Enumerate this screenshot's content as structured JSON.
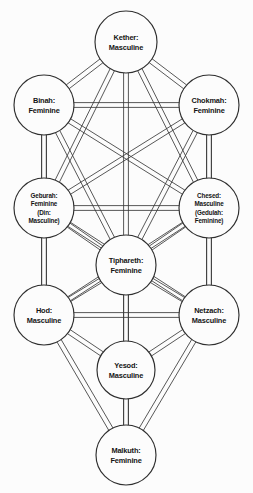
{
  "diagram": {
    "background_color": "#fcfcfc",
    "line_color": "#3a3a3a",
    "node_fill": "#fcfcfc",
    "node_stroke": "#2e2e2e",
    "nodes": [
      {
        "id": "kether",
        "name": "Kether",
        "label_line1": "Kether:",
        "label_line2": "Masculine",
        "gender": "Masculine",
        "cx": 126,
        "cy": 42,
        "r": 31
      },
      {
        "id": "binah",
        "name": "Binah",
        "label_line1": "Binah:",
        "label_line2": "Feminine",
        "gender": "Feminine",
        "cx": 44,
        "cy": 105,
        "r": 30
      },
      {
        "id": "chokmah",
        "name": "Chokmah",
        "label_line1": "Chokmah:",
        "label_line2": "Feminine",
        "gender": "Feminine",
        "cx": 209,
        "cy": 105,
        "r": 30
      },
      {
        "id": "geburah",
        "name": "Geburah",
        "label_line1": "Geburah:",
        "label_line2": "Feminine",
        "label_line3": "(Din:",
        "label_line4": "Masculine)",
        "gender": "Feminine",
        "alt_name": "Din",
        "alt_gender": "Masculine",
        "cx": 44,
        "cy": 208,
        "r": 30
      },
      {
        "id": "chesed",
        "name": "Chesed",
        "label_line1": "Chesed:",
        "label_line2": "Masculine",
        "label_line3": "(Gedulah:",
        "label_line4": "Feminine)",
        "gender": "Masculine",
        "alt_name": "Gedulah",
        "alt_gender": "Feminine",
        "cx": 209,
        "cy": 208,
        "r": 30
      },
      {
        "id": "tiphareth",
        "name": "Tiphareth",
        "label_line1": "Tiphareth:",
        "label_line2": "Feminine",
        "gender": "Feminine",
        "cx": 126,
        "cy": 265,
        "r": 30
      },
      {
        "id": "hod",
        "name": "Hod",
        "label_line1": "Hod:",
        "label_line2": "Masculine",
        "gender": "Masculine",
        "cx": 44,
        "cy": 315,
        "r": 30
      },
      {
        "id": "netzach",
        "name": "Netzach",
        "label_line1": "Netzach:",
        "label_line2": "Masculine",
        "gender": "Masculine",
        "cx": 209,
        "cy": 315,
        "r": 30
      },
      {
        "id": "yesod",
        "name": "Yesod",
        "label_line1": "Yesod:",
        "label_line2": "Masculine",
        "gender": "Masculine",
        "cx": 126,
        "cy": 370,
        "r": 29
      },
      {
        "id": "malkuth",
        "name": "Malkuth",
        "label_line1": "Malkuth:",
        "label_line2": "Feminine",
        "gender": "Feminine",
        "cx": 126,
        "cy": 455,
        "r": 30
      }
    ],
    "edges": [
      {
        "from": "kether",
        "to": "binah"
      },
      {
        "from": "kether",
        "to": "chokmah"
      },
      {
        "from": "kether",
        "to": "geburah"
      },
      {
        "from": "kether",
        "to": "chesed"
      },
      {
        "from": "kether",
        "to": "tiphareth"
      },
      {
        "from": "binah",
        "to": "chokmah"
      },
      {
        "from": "binah",
        "to": "geburah"
      },
      {
        "from": "binah",
        "to": "chesed"
      },
      {
        "from": "binah",
        "to": "tiphareth"
      },
      {
        "from": "binah",
        "to": "hod"
      },
      {
        "from": "chokmah",
        "to": "geburah"
      },
      {
        "from": "chokmah",
        "to": "chesed"
      },
      {
        "from": "chokmah",
        "to": "tiphareth"
      },
      {
        "from": "chokmah",
        "to": "netzach"
      },
      {
        "from": "geburah",
        "to": "chesed"
      },
      {
        "from": "geburah",
        "to": "tiphareth"
      },
      {
        "from": "geburah",
        "to": "hod"
      },
      {
        "from": "geburah",
        "to": "netzach"
      },
      {
        "from": "chesed",
        "to": "tiphareth"
      },
      {
        "from": "chesed",
        "to": "netzach"
      },
      {
        "from": "chesed",
        "to": "hod"
      },
      {
        "from": "tiphareth",
        "to": "hod"
      },
      {
        "from": "tiphareth",
        "to": "netzach"
      },
      {
        "from": "tiphareth",
        "to": "yesod"
      },
      {
        "from": "tiphareth",
        "to": "malkuth"
      },
      {
        "from": "hod",
        "to": "netzach"
      },
      {
        "from": "hod",
        "to": "yesod"
      },
      {
        "from": "hod",
        "to": "malkuth"
      },
      {
        "from": "netzach",
        "to": "yesod"
      },
      {
        "from": "netzach",
        "to": "malkuth"
      },
      {
        "from": "yesod",
        "to": "malkuth"
      }
    ],
    "edge_ribbon_half_width": 2.4
  }
}
